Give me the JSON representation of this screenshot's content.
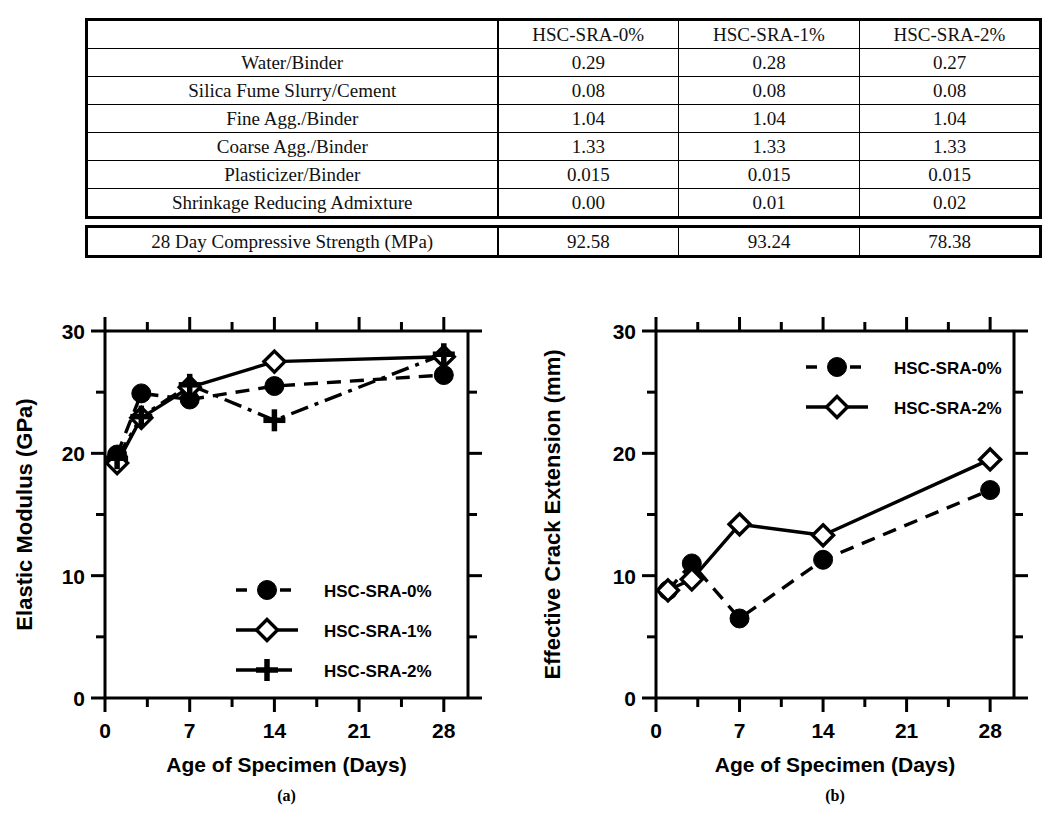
{
  "table": {
    "header": [
      "",
      "HSC-SRA-0%",
      "HSC-SRA-1%",
      "HSC-SRA-2%"
    ],
    "rows": [
      {
        "label": "Water/Binder",
        "values": [
          "0.29",
          "0.28",
          "0.27"
        ]
      },
      {
        "label": "Silica Fume Slurry/Cement",
        "values": [
          "0.08",
          "0.08",
          "0.08"
        ]
      },
      {
        "label": "Fine Agg./Binder",
        "values": [
          "1.04",
          "1.04",
          "1.04"
        ]
      },
      {
        "label": "Coarse Agg./Binder",
        "values": [
          "1.33",
          "1.33",
          "1.33"
        ]
      },
      {
        "label": "Plasticizer/Binder",
        "values": [
          "0.015",
          "0.015",
          "0.015"
        ]
      },
      {
        "label": "Shrinkage Reducing Admixture",
        "values": [
          "0.00",
          "0.01",
          "0.02"
        ]
      }
    ],
    "summary_row": {
      "label": "28 Day Compressive Strength (MPa)",
      "values": [
        "92.58",
        "93.24",
        "78.38"
      ]
    }
  },
  "chart_data": [
    {
      "id": "a",
      "panel_label": "(a)",
      "type": "line",
      "title": "",
      "xlabel": "Age of Specimen (Days)",
      "ylabel": "Elastic Modulus (GPa)",
      "xlim": [
        0,
        30
      ],
      "ylim": [
        0,
        30
      ],
      "xticks": [
        0,
        7,
        14,
        21,
        28
      ],
      "xticklabels": [
        "0",
        "7",
        "14",
        "21",
        "28"
      ],
      "xminorticks": [
        3.5,
        10.5,
        17.5,
        24.5
      ],
      "yticks": [
        0,
        10,
        20,
        30
      ],
      "yticklabels": [
        "0",
        "10",
        "20",
        "30"
      ],
      "yminorticks": [
        5,
        15,
        25
      ],
      "grid": false,
      "legend_position": "lower-center",
      "series": [
        {
          "name": "HSC-SRA-0%",
          "marker": "filled-circle",
          "line": "dashed",
          "x": [
            1,
            3,
            7,
            14,
            28
          ],
          "y": [
            19.9,
            24.9,
            24.4,
            25.5,
            26.4
          ]
        },
        {
          "name": "HSC-SRA-1%",
          "marker": "open-diamond",
          "line": "solid",
          "x": [
            1,
            3,
            7,
            14,
            28
          ],
          "y": [
            19.2,
            22.9,
            25.4,
            27.5,
            27.9
          ]
        },
        {
          "name": "HSC-SRA-2%",
          "marker": "plus",
          "line": "dash-dot",
          "x": [
            1,
            3,
            7,
            14,
            28
          ],
          "y": [
            19.6,
            23.0,
            25.6,
            22.7,
            28.1
          ]
        }
      ]
    },
    {
      "id": "b",
      "panel_label": "(b)",
      "type": "line",
      "title": "",
      "xlabel": "Age of Specimen (Days)",
      "ylabel": "Effective Crack Extension (mm)",
      "xlim": [
        0,
        30
      ],
      "ylim": [
        0,
        30
      ],
      "xticks": [
        0,
        7,
        14,
        21,
        28
      ],
      "xticklabels": [
        "0",
        "7",
        "14",
        "21",
        "28"
      ],
      "xminorticks": [
        3.5,
        10.5,
        17.5,
        24.5
      ],
      "yticks": [
        0,
        10,
        20,
        30
      ],
      "yticklabels": [
        "0",
        "10",
        "20",
        "30"
      ],
      "yminorticks": [
        5,
        15,
        25
      ],
      "grid": false,
      "legend_position": "upper-right",
      "series": [
        {
          "name": "HSC-SRA-0%",
          "marker": "filled-circle",
          "line": "dashed",
          "x": [
            1,
            3,
            7,
            14,
            28
          ],
          "y": [
            8.8,
            11.0,
            6.5,
            11.3,
            17.0
          ]
        },
        {
          "name": "HSC-SRA-2%",
          "marker": "open-diamond",
          "line": "solid",
          "x": [
            1,
            3,
            7,
            14,
            28
          ],
          "y": [
            8.8,
            9.7,
            14.2,
            13.3,
            19.5
          ]
        }
      ]
    }
  ],
  "colors": {
    "ink": "#000000",
    "background": "#ffffff"
  }
}
